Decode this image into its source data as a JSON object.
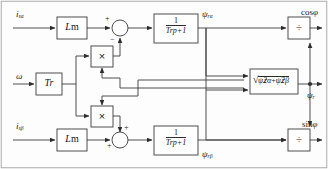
{
  "figure": {
    "type": "block-diagram",
    "colors": {
      "line": "#3a3a3a",
      "text": "#141414",
      "background": "#fdfdfd",
      "border": "#8c8c8c"
    }
  },
  "inputs": {
    "i_salpha": "i",
    "i_salpha_sub": "sα",
    "i_sbeta": "i",
    "i_sbeta_sub": "sβ",
    "omega": "ω"
  },
  "blocks": {
    "lm_top": "L",
    "lm_top_sub": "m",
    "lm_bottom": "L",
    "lm_bottom_sub": "m",
    "tr": "T",
    "tr_sub": "r",
    "tf_top_num": "1",
    "tf_top_den_T": "T",
    "tf_top_den_sub": "r",
    "tf_top_den_rest": "p+1",
    "tf_bottom_num": "1",
    "tf_bottom_den_T": "T",
    "tf_bottom_den_sub": "r",
    "tf_bottom_den_rest": "p+1",
    "mult_top": "×",
    "mult_bottom": "×",
    "div_top": "÷",
    "div_bottom": "÷",
    "sqrt_radical": "√",
    "sqrt_psi1": "ψ",
    "sqrt_psi1_sub": "rα",
    "sqrt_psi1_sup": "2",
    "sqrt_plus": "+",
    "sqrt_psi2": "ψ",
    "sqrt_psi2_sub": "rβ",
    "sqrt_psi2_sup": "2"
  },
  "signals": {
    "psi_ralpha": "ψ",
    "psi_ralpha_sub": "rα",
    "psi_rbeta": "ψ",
    "psi_rbeta_sub": "rβ",
    "psi_r": "ψ",
    "psi_r_sub": "r"
  },
  "outputs": {
    "cos_phi_fn": "cos",
    "cos_phi_arg": "φ",
    "sin_phi_fn": "sin",
    "sin_phi_arg": "φ",
    "psi_r": "ψ",
    "psi_r_sub": "r"
  },
  "sum_signs": {
    "top_left": "+",
    "top_bottom": "−",
    "bottom_left": "+",
    "bottom_top": "+"
  }
}
